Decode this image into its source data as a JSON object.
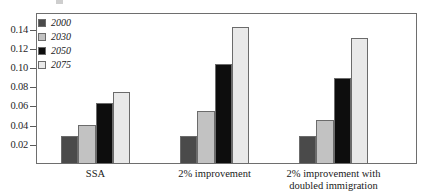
{
  "chart_data": {
    "type": "bar",
    "title": "",
    "subtitle": "",
    "xlabel": "",
    "ylabel": "",
    "categories": [
      "SSA",
      "2% improvement",
      "2% improvement with doubled immigration"
    ],
    "category_lines": [
      [
        "SSA"
      ],
      [
        "2% improvement"
      ],
      [
        "2% improvement with",
        "doubled immigration"
      ]
    ],
    "series": [
      {
        "name": "2000",
        "color": "#4a4a4a",
        "values": [
          0.029,
          0.029,
          0.029
        ]
      },
      {
        "name": "2030",
        "color": "#c2c2c2",
        "values": [
          0.041,
          0.055,
          0.046
        ]
      },
      {
        "name": "2050",
        "color": "#0d0d0d",
        "values": [
          0.064,
          0.104,
          0.09
        ]
      },
      {
        "name": "2075",
        "color": "#e9e9e9",
        "values": [
          0.075,
          0.143,
          0.131
        ]
      }
    ],
    "ylim": [
      0,
      0.1565
    ],
    "yticks": [
      0.02,
      0.04,
      0.06,
      0.08,
      0.1,
      0.12,
      0.14
    ],
    "ytick_labels": [
      "0.02",
      "0.04",
      "0.06",
      "0.08",
      "0.10",
      "0.12",
      "0.14"
    ],
    "grid": false,
    "legend": {
      "position": "top-left-inside",
      "entries": [
        {
          "label": "2000",
          "color": "#4a4a4a"
        },
        {
          "label": "2030",
          "color": "#c2c2c2"
        },
        {
          "label": "2050",
          "color": "#0d0d0d"
        },
        {
          "label": "2075",
          "color": "#e9e9e9"
        }
      ]
    }
  }
}
